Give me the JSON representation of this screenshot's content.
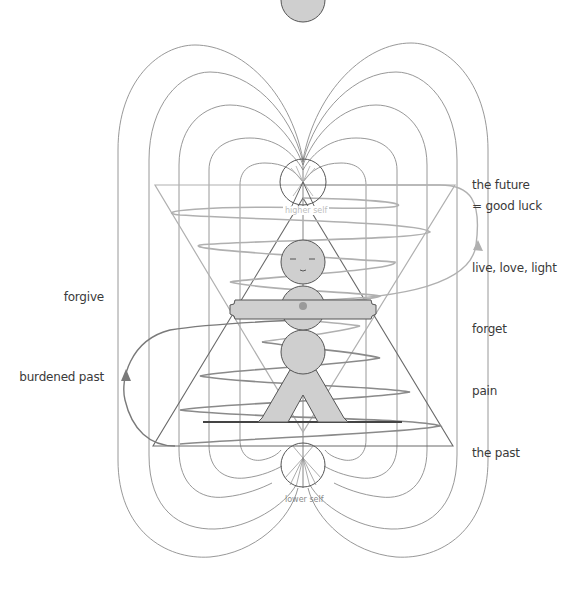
{
  "diagram": {
    "center_labels": {
      "higher_self": "higher self",
      "lower_self": "lower self"
    },
    "right_labels": [
      {
        "id": "future",
        "text": "the future"
      },
      {
        "id": "good-luck",
        "text": "= good luck"
      },
      {
        "id": "live-love-light",
        "text": "live, love, light"
      },
      {
        "id": "forget",
        "text": "forget"
      },
      {
        "id": "pain",
        "text": "pain"
      },
      {
        "id": "the-past",
        "text": "the past"
      }
    ],
    "left_labels": [
      {
        "id": "forgive",
        "text": "forgive"
      },
      {
        "id": "burdened-past",
        "text": "burdened past"
      }
    ],
    "colors": {
      "field_lines": "#8a8a8a",
      "dark_lines": "#555555",
      "light_lines": "#b4b4b4",
      "figure_fill": "#cfcfcf",
      "text": "#3a3a3a",
      "higher_self_text": "#bdbdbd",
      "lower_self_text": "#8a8a8a"
    }
  }
}
